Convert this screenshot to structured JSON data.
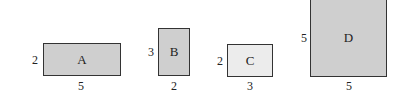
{
  "shapes": [
    {
      "label": "A",
      "height_label": "2",
      "width_label": "5",
      "fill": "#cfcfcf"
    },
    {
      "label": "B",
      "height_label": "3",
      "width_label": "2",
      "fill": "#cfcfcf"
    },
    {
      "label": "C",
      "height_label": "2",
      "width_label": "3",
      "fill": "#ececec"
    },
    {
      "label": "D",
      "height_label": "5",
      "width_label": "5",
      "fill": "#cfcfcf"
    }
  ]
}
